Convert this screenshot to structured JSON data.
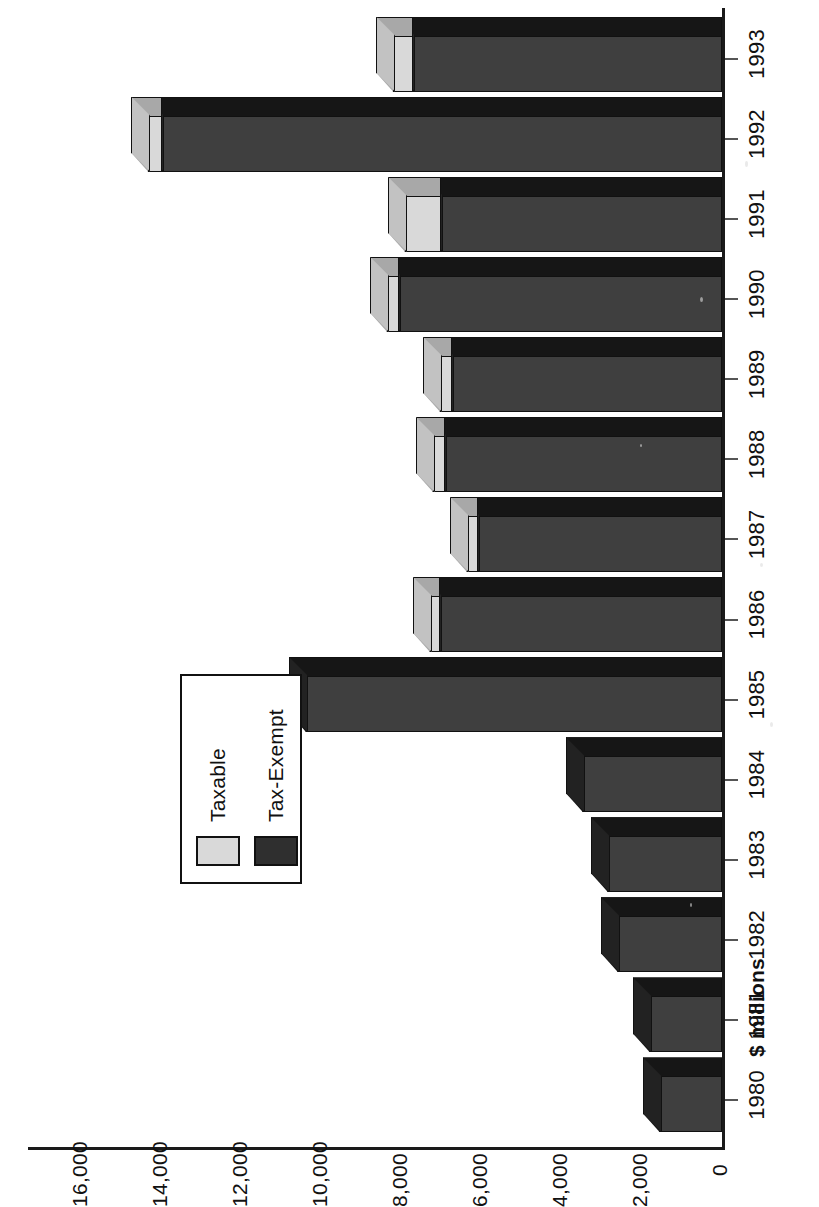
{
  "chart_data": {
    "type": "bar",
    "orientation": "vertical-rotated-90ccw",
    "stacked": true,
    "title": "",
    "subtitle": "",
    "xlabel": "",
    "ylabel": "$ millions",
    "ylim": [
      0,
      16000
    ],
    "ytick_step": 2000,
    "grid": false,
    "legend_position": "inside-upper-left",
    "categories": [
      "1980",
      "1981",
      "1982",
      "1983",
      "1984",
      "1985",
      "1986",
      "1987",
      "1988",
      "1989",
      "1990",
      "1991",
      "1992",
      "1993"
    ],
    "ytick_labels": [
      "0",
      "2,000",
      "4,000",
      "6,000",
      "8,000",
      "10,000",
      "12,000",
      "14,000",
      "16,000"
    ],
    "ytick_values": [
      0,
      2000,
      4000,
      6000,
      8000,
      10000,
      12000,
      14000,
      16000
    ],
    "series": [
      {
        "name": "Tax-Exempt",
        "color": "#3b3b3b",
        "values": [
          1550,
          1800,
          2600,
          2850,
          3475,
          10400,
          7050,
          6100,
          6925,
          6750,
          8075,
          7025,
          14000,
          7725
        ]
      },
      {
        "name": "Taxable",
        "color": "#d9d9d9",
        "values": [
          0,
          0,
          0,
          0,
          0,
          0,
          250,
          275,
          300,
          300,
          300,
          900,
          350,
          500
        ]
      }
    ],
    "totals": [
      1550,
      1800,
      2600,
      2850,
      3475,
      10400,
      7300,
      6375,
      7225,
      7050,
      8375,
      7925,
      14350,
      8225
    ],
    "annotations": []
  },
  "axis": {
    "value_axis_title": "$ millions"
  },
  "legend": {
    "entries": [
      {
        "label": "Taxable",
        "swatch": "light-gray-swatch"
      },
      {
        "label": "Tax-Exempt",
        "swatch": "dark-gray-swatch"
      }
    ]
  }
}
